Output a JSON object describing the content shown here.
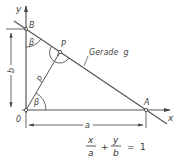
{
  "diagram": {
    "labels": {
      "y_axis": "y",
      "x_axis": "x",
      "origin": "0",
      "point_b": "B",
      "point_a": "A",
      "point_p": "P",
      "line_name": "Gerade  g",
      "perpendicular": "p",
      "dim_b": "b",
      "dim_a": "a",
      "angle_at_b": "β",
      "angle_at_o": "β"
    },
    "formula": {
      "term1_num": "x",
      "term1_den": "a",
      "plus": "+",
      "term2_num": "y",
      "term2_den": "b",
      "equals": "=",
      "rhs": "1"
    },
    "colors": {
      "line": "#555555",
      "text": "#444444"
    }
  }
}
